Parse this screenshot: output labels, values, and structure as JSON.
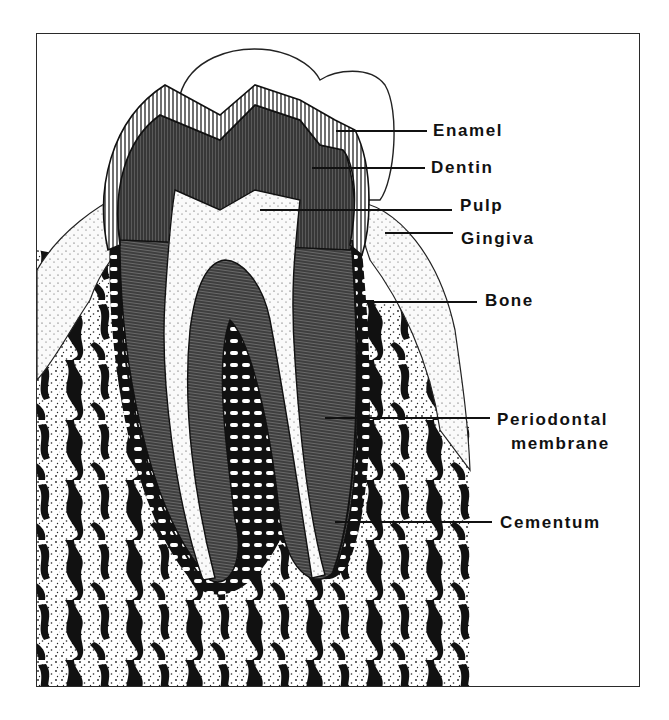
{
  "figure": {
    "type": "anatomical-cross-section",
    "colors": {
      "ink": "#111111",
      "paper": "#ffffff",
      "frame": "#2a2a2a"
    }
  },
  "labels": [
    {
      "id": "enamel",
      "text": "Enamel"
    },
    {
      "id": "dentin",
      "text": "Dentin"
    },
    {
      "id": "pulp",
      "text": "Pulp"
    },
    {
      "id": "gingiva",
      "text": "Gingiva"
    },
    {
      "id": "bone",
      "text": "Bone"
    },
    {
      "id": "periodontal",
      "text": "Periodontal"
    },
    {
      "id": "membrane",
      "text": "membrane"
    },
    {
      "id": "cementum",
      "text": "Cementum"
    }
  ]
}
